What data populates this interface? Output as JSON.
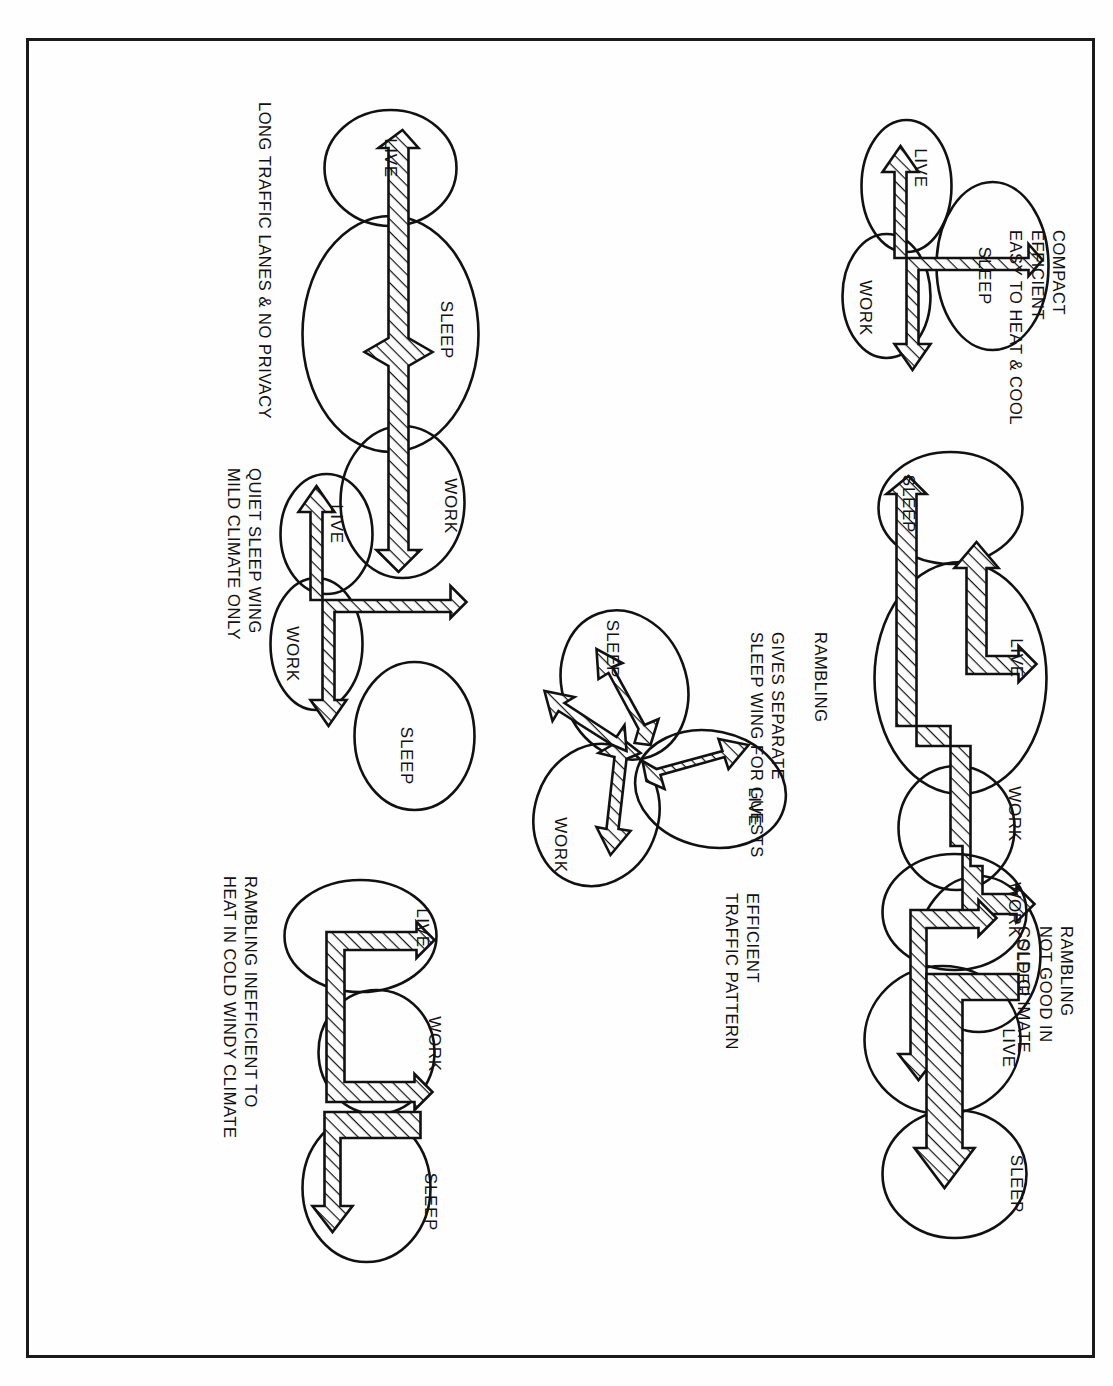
{
  "document": {
    "type": "architectural-bubble-diagram-plate",
    "orientation": "rotated-90-ccw",
    "border_color": "#1a1a1a",
    "ink_color": "#111111",
    "paper_color": "#fefefe"
  },
  "zone_labels": {
    "live": "LIVE",
    "work": "WORK",
    "sleep": "SLEEP"
  },
  "schemes": [
    {
      "id": "compact-cluster",
      "caption": "COMPACT\nEFFICIENT\nEASY TO HEAT & COOL",
      "zones": [
        "LIVE",
        "SLEEP",
        "WORK"
      ],
      "arrangement": "three-overlapping-ovals-clustered",
      "traffic": "short tee-shaped circulation spine"
    },
    {
      "id": "long-linear",
      "caption": "LONG TRAFFIC LANES & NO PRIVACY",
      "zones": [
        "LIVE",
        "SLEEP",
        "WORK"
      ],
      "arrangement": "three-ovals-in-a-row",
      "traffic": "single long circulation lane end to end"
    },
    {
      "id": "separate-sleep-wing",
      "caption": "RAMBLING\n\nGIVES SEPARATE\nSLEEP WING FOR GUESTS",
      "zones": [
        "SLEEP",
        "LIVE",
        "WORK",
        "SLEEP"
      ],
      "arrangement": "four-zone-rambling-chain",
      "traffic": "branched circulation with offset jogs"
    },
    {
      "id": "quiet-sleep-wing",
      "caption": "QUIET SLEEP WING\nMILD CLIMATE ONLY",
      "zones": [
        "LIVE",
        "WORK",
        "SLEEP"
      ],
      "arrangement": "tee-plan with detached sleep wing",
      "traffic": "tee-shaped circulation spine"
    },
    {
      "id": "rambling-cold-climate",
      "caption": "RAMBLING\nNOT GOOD IN\nCOLD CLIMATE",
      "zones": [
        "WORK",
        "LIVE",
        "SLEEP"
      ],
      "arrangement": "three-ovals-offset-chain",
      "traffic": "double parallel circulation lanes"
    },
    {
      "id": "efficient-traffic-pattern",
      "caption": "EFFICIENT\nTRAFFIC PATTERN",
      "zones": [
        "LIVE",
        "SLEEP",
        "WORK"
      ],
      "arrangement": "pinwheel-of-three-ovals",
      "traffic": "radial three-way traffic pattern"
    },
    {
      "id": "rambling-inefficient-heat",
      "caption": "RAMBLING INEFFICIENT TO\nHEAT IN COLD WINDY CLIMATE",
      "zones": [
        "LIVE",
        "WORK",
        "SLEEP"
      ],
      "arrangement": "staggered-chain",
      "traffic": "stepped circulation with jog"
    }
  ]
}
